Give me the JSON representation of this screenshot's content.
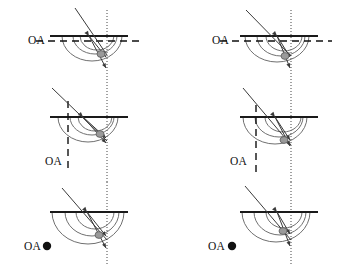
{
  "figure": {
    "title": "",
    "background_color": "#ffffff",
    "width": 345,
    "height": 271,
    "columns": 2,
    "rows": 3,
    "labels": {
      "optical_axis": "OA",
      "point_marker_glyph": "●"
    },
    "colors": {
      "flat_surface": "#1a1a1a",
      "arc_stroke": "#707070",
      "ray_stroke": "#3a3a3a",
      "dashed_axis": "#111111",
      "dotted_axis": "#444444",
      "blob_fill": "#9a9a9a",
      "blob_stroke": "#5a5a5a",
      "text": "#111111"
    }
  },
  "chart_data": {
    "type": "diagram",
    "subtype": "optics-ray-diagram",
    "panel_count": 6,
    "panels": [
      {
        "id": "panel-left-1",
        "column": "left",
        "row": 1,
        "oa_label": "OA",
        "oa_label_x": 28,
        "oa_label_y": 44,
        "oa_type": "horizontal-dashed",
        "oa_y": 41,
        "oa_x_start": 36,
        "oa_x_end": 143,
        "flat_surface": {
          "x1": 50,
          "y": 36,
          "x2": 128
        },
        "arcs": [
          {
            "cx": 92,
            "cy": 36,
            "rx": 30,
            "ry": 25
          },
          {
            "cx": 95,
            "cy": 36,
            "rx": 22,
            "ry": 18
          },
          {
            "cx": 97,
            "cy": 36,
            "rx": 17,
            "ry": 14
          }
        ],
        "dotted_axis_x": 107,
        "dotted_axis_y1": 10,
        "dotted_axis_y2": 88,
        "incoming_ray": {
          "x1": 75,
          "y1": 8,
          "x2": 107,
          "y2": 55
        },
        "arrow_on_surface": {
          "x": 89,
          "y": 36
        },
        "blob": {
          "cx": 101,
          "cy": 54,
          "rx": 4.0,
          "ry": 3.4
        },
        "focus_marks": [
          {
            "x": 106,
            "y": 57
          },
          {
            "x": 106,
            "y": 68
          }
        ]
      },
      {
        "id": "panel-left-2",
        "column": "left",
        "row": 2,
        "oa_label": "OA",
        "oa_label_x": 45,
        "oa_label_y": 165,
        "oa_type": "vertical-dashed",
        "oa_x": 68,
        "oa_y_start": 101,
        "oa_y_end": 172,
        "flat_surface": {
          "x1": 50,
          "y": 117,
          "x2": 128
        },
        "arcs": [
          {
            "cx": 88,
            "cy": 117,
            "rx": 30,
            "ry": 25
          },
          {
            "cx": 92,
            "cy": 117,
            "rx": 22,
            "ry": 18
          },
          {
            "cx": 95,
            "cy": 117,
            "rx": 17,
            "ry": 14
          }
        ],
        "dotted_axis_x": 107,
        "dotted_axis_y1": 88,
        "dotted_axis_y2": 182,
        "incoming_ray": {
          "x1": 52,
          "y1": 88,
          "x2": 107,
          "y2": 141
        },
        "arrow_on_surface": {
          "x": 83,
          "y": 117
        },
        "blob": {
          "cx": 100,
          "cy": 134,
          "rx": 4.0,
          "ry": 3.4
        },
        "focus_marks": [
          {
            "x": 106,
            "y": 138
          },
          {
            "x": 106,
            "y": 143
          }
        ]
      },
      {
        "id": "panel-left-3",
        "column": "left",
        "row": 3,
        "oa_label": "OA",
        "oa_label_x": 24,
        "oa_label_y": 250,
        "oa_type": "point",
        "oa_point": {
          "cx": 47,
          "cy": 246,
          "r": 4.2
        },
        "flat_surface": {
          "x1": 50,
          "y": 212,
          "x2": 128
        },
        "arcs": [
          {
            "cx": 88,
            "cy": 212,
            "rx": 36,
            "ry": 32
          },
          {
            "cx": 92,
            "cy": 212,
            "rx": 27,
            "ry": 24
          },
          {
            "cx": 95,
            "cy": 212,
            "rx": 19,
            "ry": 17
          }
        ],
        "dotted_axis_x": 107,
        "dotted_axis_y1": 182,
        "dotted_axis_y2": 265,
        "incoming_ray": {
          "x1": 62,
          "y1": 188,
          "x2": 107,
          "y2": 240
        },
        "arrow_on_surface": {
          "x": 87,
          "y": 212
        },
        "blob": {
          "cx": 99,
          "cy": 235,
          "rx": 4.0,
          "ry": 3.4
        },
        "focus_marks": [
          {
            "x": 106,
            "y": 236
          },
          {
            "x": 106,
            "y": 248
          }
        ]
      },
      {
        "id": "panel-right-1",
        "column": "right",
        "row": 1,
        "oa_label": "OA",
        "oa_label_x": 212,
        "oa_label_y": 44,
        "oa_type": "horizontal-dashed",
        "oa_y": 41,
        "oa_x_start": 220,
        "oa_x_end": 332,
        "flat_surface": {
          "x1": 240,
          "y": 36,
          "x2": 318
        },
        "arcs": [
          {
            "cx": 277,
            "cy": 36,
            "rx": 32,
            "ry": 26
          },
          {
            "cx": 281,
            "cy": 36,
            "rx": 24,
            "ry": 20
          },
          {
            "cx": 284,
            "cy": 36,
            "rx": 18,
            "ry": 15
          }
        ],
        "dotted_axis_x": 291,
        "dotted_axis_y1": 10,
        "dotted_axis_y2": 88,
        "incoming_ray": {
          "x1": 246,
          "y1": 10,
          "x2": 291,
          "y2": 56
        },
        "arrow_on_surface": {
          "x": 277,
          "y": 36
        },
        "blob": {
          "cx": 285,
          "cy": 56,
          "rx": 4.0,
          "ry": 3.4
        },
        "focus_marks": [
          {
            "x": 290,
            "y": 57
          },
          {
            "x": 290,
            "y": 68
          }
        ]
      },
      {
        "id": "panel-right-2",
        "column": "right",
        "row": 2,
        "oa_label": "OA",
        "oa_label_x": 230,
        "oa_label_y": 165,
        "oa_type": "vertical-dashed",
        "oa_x": 256,
        "oa_y_start": 105,
        "oa_y_end": 172,
        "flat_surface": {
          "x1": 240,
          "y": 117,
          "x2": 318
        },
        "arcs": [
          {
            "cx": 275,
            "cy": 117,
            "rx": 32,
            "ry": 27
          },
          {
            "cx": 279,
            "cy": 117,
            "rx": 24,
            "ry": 20
          },
          {
            "cx": 283,
            "cy": 117,
            "rx": 18,
            "ry": 15
          }
        ],
        "dotted_axis_x": 291,
        "dotted_axis_y1": 88,
        "dotted_axis_y2": 182,
        "incoming_ray": {
          "x1": 243,
          "y1": 88,
          "x2": 291,
          "y2": 145
        },
        "arrow_on_surface": {
          "x": 275,
          "y": 117
        },
        "blob": {
          "cx": 284,
          "cy": 140,
          "rx": 4.0,
          "ry": 3.4
        },
        "focus_marks": [
          {
            "x": 290,
            "y": 140
          },
          {
            "x": 290,
            "y": 146
          }
        ]
      },
      {
        "id": "panel-right-3",
        "column": "right",
        "row": 3,
        "oa_label": "OA",
        "oa_label_x": 208,
        "oa_label_y": 250,
        "oa_type": "point",
        "oa_point": {
          "cx": 232,
          "cy": 246,
          "r": 4.2
        },
        "flat_surface": {
          "x1": 240,
          "y": 212,
          "x2": 318
        },
        "arcs": [
          {
            "cx": 276,
            "cy": 212,
            "rx": 34,
            "ry": 30
          },
          {
            "cx": 280,
            "cy": 212,
            "rx": 26,
            "ry": 23
          },
          {
            "cx": 284,
            "cy": 212,
            "rx": 18,
            "ry": 16
          }
        ],
        "dotted_axis_x": 291,
        "dotted_axis_y1": 182,
        "dotted_axis_y2": 265,
        "incoming_ray": {
          "x1": 245,
          "y1": 186,
          "x2": 291,
          "y2": 240
        },
        "arrow_on_surface": {
          "x": 277,
          "y": 212
        },
        "blob": {
          "cx": 283,
          "cy": 231,
          "rx": 4.0,
          "ry": 3.4
        },
        "focus_marks": [
          {
            "x": 290,
            "y": 234
          },
          {
            "x": 290,
            "y": 246
          }
        ]
      }
    ]
  }
}
